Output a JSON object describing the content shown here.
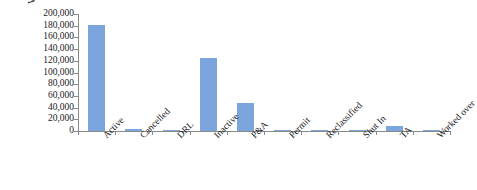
{
  "chart_data": {
    "type": "bar",
    "title": "",
    "xlabel": "",
    "ylabel": "Well count",
    "categories": [
      "Active",
      "Cancelled",
      "DRL",
      "Inactive",
      "P&A",
      "Permit",
      "Reclassified",
      "Shut In",
      "TA",
      "Worked over"
    ],
    "values": [
      182000,
      3000,
      1500,
      124000,
      48000,
      400,
      300,
      300,
      8000,
      200
    ],
    "ylim": [
      0,
      200000
    ],
    "ytick_labels": [
      "200,000",
      "180,000",
      "160,000",
      "140,000",
      "120,000",
      "100,000",
      "80,000",
      "60,000",
      "40,000",
      "20,000",
      "0"
    ],
    "ytick_values": [
      200000,
      180000,
      160000,
      140000,
      120000,
      100000,
      80000,
      60000,
      40000,
      20000,
      0
    ],
    "grid": false,
    "legend": false,
    "series": [
      {
        "name": "Well count",
        "values": [
          182000,
          3000,
          1500,
          124000,
          48000,
          400,
          300,
          300,
          8000,
          200
        ]
      }
    ],
    "bar_color": "#7ba5dc",
    "axis_color": "#8a8a8a",
    "background": "#ffffff"
  }
}
